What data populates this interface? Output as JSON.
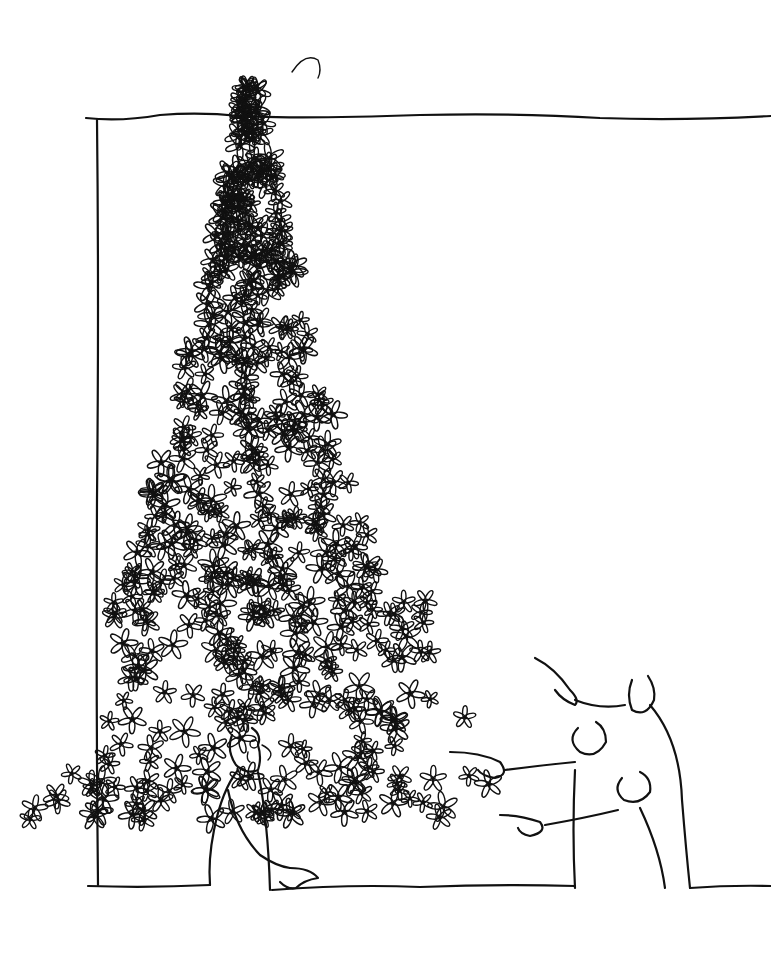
{
  "image": {
    "kind": "pen-and-ink cartoon illustration",
    "width": 771,
    "height": 955,
    "background_color": "#ffffff",
    "ink_color": "#111111"
  },
  "scene": {
    "frame": {
      "description": "hand-drawn wall / picture frame outline",
      "top_y": 118,
      "left_x": 97,
      "bottom_y": 885
    },
    "flower_tree": {
      "description": "enormous cone of daisy-like flowers sprouting from a man's head, tip at top center",
      "apex": [
        295,
        60
      ],
      "base_width": 440
    },
    "main_figure": {
      "description": "bewildered man in suit with flowers growing from his head, palm open",
      "head": [
        240,
        740
      ]
    },
    "onlookers": [
      {
        "description": "tall man pointing upward, smiling",
        "head": [
          640,
          685
        ]
      },
      {
        "description": "middle man pointing left, grinning",
        "head": [
          590,
          735
        ]
      },
      {
        "description": "short man pointing left, smiling",
        "head": [
          640,
          780
        ]
      }
    ]
  }
}
